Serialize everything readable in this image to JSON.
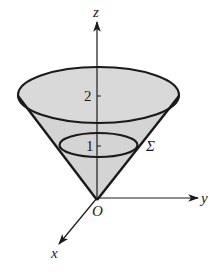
{
  "diagram": {
    "type": "3d-cone-surface",
    "surface_label": "Σ",
    "origin_label": "O",
    "axes": {
      "x": {
        "label": "x"
      },
      "y": {
        "label": "y"
      },
      "z": {
        "label": "z"
      }
    },
    "z_ticks": [
      {
        "value": "1",
        "label": "1"
      },
      {
        "value": "2",
        "label": "2"
      }
    ],
    "colors": {
      "fill": "#d4d4d4",
      "stroke": "#1a1a1a",
      "background": "#ffffff"
    }
  }
}
